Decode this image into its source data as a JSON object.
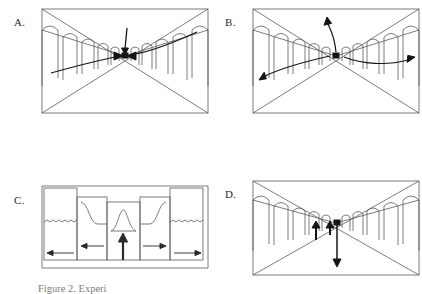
{
  "figure": {
    "caption": "Figure 2. Experi",
    "background_color": "#ffffff",
    "ink_color": "#4a4a4a",
    "arrow_color": "#1a1a1a",
    "panel_count": 4
  },
  "panels": [
    {
      "id": "A",
      "label": "A.",
      "type": "perspective-corridor",
      "description": "Arcade corridor in one-point perspective with arrows converging on the vanishing point",
      "vanishing_point": {
        "x": 0.5,
        "y": 0.46,
        "marker": "filled-square"
      },
      "arrows": [
        {
          "name": "arrow-down-to-vp",
          "direction": "down",
          "target": "vanishing-point",
          "style": "straight"
        },
        {
          "name": "arrow-left-inward",
          "direction": "right",
          "target": "vanishing-point",
          "style": "short"
        },
        {
          "name": "arrow-right-inward",
          "direction": "left",
          "target": "vanishing-point",
          "style": "short"
        },
        {
          "name": "curve-sweep-through-vp",
          "direction": "up-right",
          "style": "long-s-curve"
        }
      ],
      "arch_count_per_side": 5
    },
    {
      "id": "B",
      "label": "B.",
      "type": "perspective-corridor",
      "description": "Arcade corridor in one-point perspective with arrows radiating outward from the vanishing point",
      "vanishing_point": {
        "x": 0.5,
        "y": 0.46,
        "marker": "filled-square"
      },
      "arrows": [
        {
          "name": "arrow-up-from-vp",
          "direction": "up",
          "origin": "vanishing-point",
          "style": "curved"
        },
        {
          "name": "curve-out-left",
          "direction": "down-left",
          "origin": "vanishing-point",
          "style": "long-curve"
        },
        {
          "name": "curve-out-right",
          "direction": "right",
          "origin": "vanishing-point",
          "style": "long-curve"
        }
      ],
      "arch_count_per_side": 5
    },
    {
      "id": "C",
      "label": "C.",
      "type": "plan-view",
      "description": "Top-down plan view of staggered blocks with wavy level lines, a central peaked profile curve and directional flow arrows",
      "blocks": [
        {
          "name": "block-outer-left",
          "has_wavy_line": true
        },
        {
          "name": "block-inner-left",
          "has_wavy_line": false
        },
        {
          "name": "block-center",
          "has_wavy_line": false
        },
        {
          "name": "block-inner-right",
          "has_wavy_line": false
        },
        {
          "name": "block-outer-right",
          "has_wavy_line": true
        }
      ],
      "center_profile": {
        "name": "central-peak-curve",
        "shape": "bump"
      },
      "arrows": [
        {
          "name": "arrow-outer-left",
          "direction": "left"
        },
        {
          "name": "arrow-inner-left",
          "direction": "left"
        },
        {
          "name": "arrow-center-up",
          "direction": "up",
          "style": "bold"
        },
        {
          "name": "arrow-inner-right",
          "direction": "right"
        },
        {
          "name": "arrow-outer-right",
          "direction": "right"
        }
      ]
    },
    {
      "id": "D",
      "label": "D.",
      "type": "perspective-corridor",
      "description": "Arcade corridor in one-point perspective with two short upward arrows near the vanishing point and one long downward arrow",
      "vanishing_point": {
        "x": 0.5,
        "y": 0.46,
        "marker": "filled-square"
      },
      "arrows": [
        {
          "name": "arrow-up-left-short",
          "direction": "up",
          "style": "short"
        },
        {
          "name": "arrow-up-right-short",
          "direction": "up",
          "style": "short"
        },
        {
          "name": "arrow-down-long",
          "direction": "down",
          "style": "long"
        }
      ],
      "arch_count_per_side": 5
    }
  ]
}
